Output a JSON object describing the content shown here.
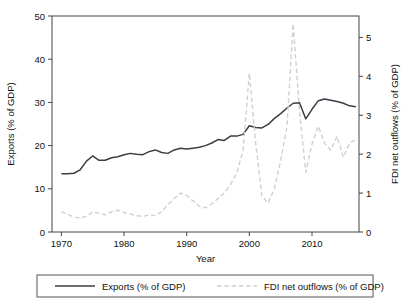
{
  "chart_data": {
    "type": "line",
    "title": "",
    "xlabel": "Year",
    "ylabel": "Exports (% of GDP)",
    "y2label": "FDI net outflows (% of GDP)",
    "xlim": [
      1968.5,
      2017.5
    ],
    "ylim": [
      0,
      50
    ],
    "y2lim": [
      0,
      5.55
    ],
    "xticks": [
      1970,
      1980,
      1990,
      2000,
      2010
    ],
    "xticklabels": [
      "1970",
      "1980",
      "1990",
      "2000",
      "2010"
    ],
    "yticks": [
      0,
      10,
      20,
      30,
      40,
      50
    ],
    "yticklabels": [
      "0",
      "10",
      "20",
      "30",
      "40",
      "50"
    ],
    "y2ticks": [
      0,
      1,
      2,
      3,
      4,
      5
    ],
    "y2ticklabels": [
      "0",
      "1",
      "2",
      "3",
      "4",
      "5"
    ],
    "grid": false,
    "legend_position": "below",
    "x": [
      1970,
      1971,
      1972,
      1973,
      1974,
      1975,
      1976,
      1977,
      1978,
      1979,
      1980,
      1981,
      1982,
      1983,
      1984,
      1985,
      1986,
      1987,
      1988,
      1989,
      1990,
      1991,
      1992,
      1993,
      1994,
      1995,
      1996,
      1997,
      1998,
      1999,
      2000,
      2001,
      2002,
      2003,
      2004,
      2005,
      2006,
      2007,
      2008,
      2009,
      2010,
      2011,
      2012,
      2013,
      2014,
      2015,
      2016,
      2017
    ],
    "series": [
      {
        "name": "Exports (% of GDP)",
        "axis": "left",
        "style": "solid",
        "color": "#3c3c46",
        "width": 1.5,
        "values": [
          13.5,
          13.5,
          13.6,
          14.4,
          16.4,
          17.6,
          16.6,
          16.6,
          17.2,
          17.4,
          17.9,
          18.2,
          18.0,
          17.9,
          18.6,
          19.0,
          18.4,
          18.2,
          19.0,
          19.4,
          19.2,
          19.4,
          19.6,
          20.0,
          20.6,
          21.4,
          21.2,
          22.2,
          22.2,
          22.6,
          24.6,
          24.2,
          24.1,
          24.9,
          26.3,
          27.4,
          28.7,
          29.8,
          29.9,
          26.2,
          28.4,
          30.4,
          30.8,
          30.5,
          30.2,
          29.8,
          29.2,
          29.0
        ]
      },
      {
        "name": "FDI net outflows (% of GDP)",
        "axis": "right",
        "style": "dashed",
        "color": "#cfcfd4",
        "width": 1.4,
        "values": [
          0.52,
          0.46,
          0.38,
          0.36,
          0.4,
          0.52,
          0.48,
          0.44,
          0.52,
          0.56,
          0.5,
          0.46,
          0.42,
          0.4,
          0.44,
          0.42,
          0.52,
          0.7,
          0.86,
          1.0,
          0.94,
          0.8,
          0.66,
          0.62,
          0.72,
          0.86,
          1.0,
          1.22,
          1.52,
          2.1,
          4.08,
          2.3,
          0.92,
          0.74,
          1.12,
          1.84,
          2.7,
          5.35,
          3.1,
          1.54,
          2.26,
          2.72,
          2.28,
          2.1,
          2.46,
          1.92,
          2.28,
          2.38
        ]
      }
    ],
    "legend_entries": [
      {
        "label": "Exports (% of GDP)",
        "style": "solid",
        "color": "#3c3c46"
      },
      {
        "label": "FDI net outflows (% of GDP)",
        "style": "dashed",
        "color": "#cfcfd4"
      }
    ]
  }
}
